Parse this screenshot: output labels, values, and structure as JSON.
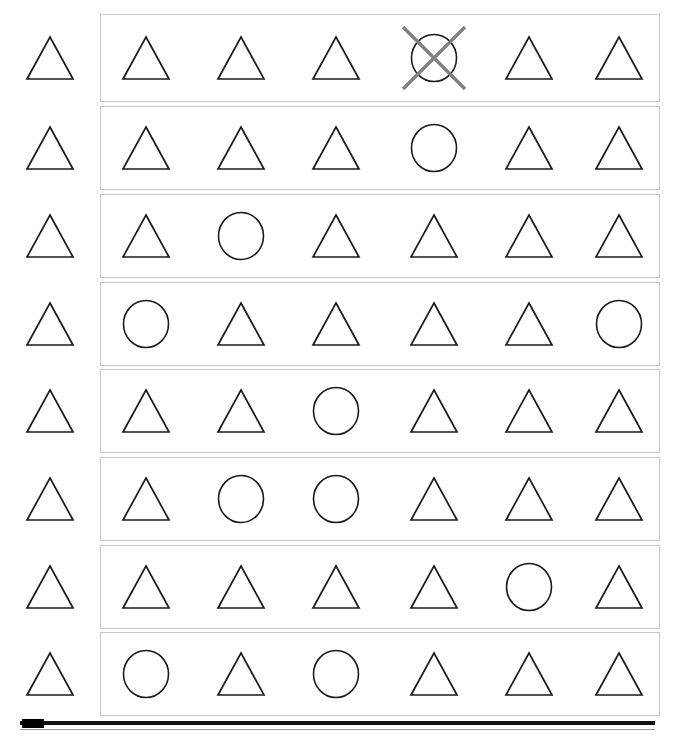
{
  "app": {
    "title": "Shape Sequence Matching Task",
    "background_color": "#ffffff"
  },
  "style": {
    "shape_stroke_color": "#1a1a1a",
    "box_border_color": "#c8c8c8",
    "cross_out_color": "#808080",
    "scrollbar_color": "#000000"
  },
  "legend": {
    "triangle_label": "triangle",
    "circle_label": "circle",
    "crossed_label": "crossed-out circle"
  },
  "grid": {
    "row_count": 8,
    "column_count": 6,
    "cue_column_label": "cue",
    "column_x": [
      45,
      140,
      235,
      333,
      428,
      518
    ],
    "rows": [
      {
        "index": 1,
        "cue": "triangle",
        "box_top": 14,
        "box_height": 88,
        "cells": [
          {
            "shape": "triangle",
            "crossed_out": false
          },
          {
            "shape": "triangle",
            "crossed_out": false
          },
          {
            "shape": "triangle",
            "crossed_out": false
          },
          {
            "shape": "circle",
            "crossed_out": true
          },
          {
            "shape": "triangle",
            "crossed_out": false
          },
          {
            "shape": "triangle",
            "crossed_out": false
          }
        ]
      },
      {
        "index": 2,
        "cue": "triangle",
        "box_top": 106,
        "box_height": 84,
        "cells": [
          {
            "shape": "triangle",
            "crossed_out": false
          },
          {
            "shape": "triangle",
            "crossed_out": false
          },
          {
            "shape": "triangle",
            "crossed_out": false
          },
          {
            "shape": "circle",
            "crossed_out": false
          },
          {
            "shape": "triangle",
            "crossed_out": false
          },
          {
            "shape": "triangle",
            "crossed_out": false
          }
        ]
      },
      {
        "index": 3,
        "cue": "triangle",
        "box_top": 194,
        "box_height": 84,
        "cells": [
          {
            "shape": "triangle",
            "crossed_out": false
          },
          {
            "shape": "circle",
            "crossed_out": false
          },
          {
            "shape": "triangle",
            "crossed_out": false
          },
          {
            "shape": "triangle",
            "crossed_out": false
          },
          {
            "shape": "triangle",
            "crossed_out": false
          },
          {
            "shape": "triangle",
            "crossed_out": false
          }
        ]
      },
      {
        "index": 4,
        "cue": "triangle",
        "box_top": 282,
        "box_height": 84,
        "cells": [
          {
            "shape": "circle",
            "crossed_out": false
          },
          {
            "shape": "triangle",
            "crossed_out": false
          },
          {
            "shape": "triangle",
            "crossed_out": false
          },
          {
            "shape": "triangle",
            "crossed_out": false
          },
          {
            "shape": "triangle",
            "crossed_out": false
          },
          {
            "shape": "circle",
            "crossed_out": false
          }
        ]
      },
      {
        "index": 5,
        "cue": "triangle",
        "box_top": 369,
        "box_height": 84,
        "cells": [
          {
            "shape": "triangle",
            "crossed_out": false
          },
          {
            "shape": "triangle",
            "crossed_out": false
          },
          {
            "shape": "circle",
            "crossed_out": false
          },
          {
            "shape": "triangle",
            "crossed_out": false
          },
          {
            "shape": "triangle",
            "crossed_out": false
          },
          {
            "shape": "triangle",
            "crossed_out": false
          }
        ]
      },
      {
        "index": 6,
        "cue": "triangle",
        "box_top": 457,
        "box_height": 84,
        "cells": [
          {
            "shape": "triangle",
            "crossed_out": false
          },
          {
            "shape": "circle",
            "crossed_out": false
          },
          {
            "shape": "circle",
            "crossed_out": false
          },
          {
            "shape": "triangle",
            "crossed_out": false
          },
          {
            "shape": "triangle",
            "crossed_out": false
          },
          {
            "shape": "triangle",
            "crossed_out": false
          }
        ]
      },
      {
        "index": 7,
        "cue": "triangle",
        "box_top": 545,
        "box_height": 84,
        "cells": [
          {
            "shape": "triangle",
            "crossed_out": false
          },
          {
            "shape": "triangle",
            "crossed_out": false
          },
          {
            "shape": "triangle",
            "crossed_out": false
          },
          {
            "shape": "triangle",
            "crossed_out": false
          },
          {
            "shape": "circle",
            "crossed_out": false
          },
          {
            "shape": "triangle",
            "crossed_out": false
          }
        ]
      },
      {
        "index": 8,
        "cue": "triangle",
        "box_top": 632,
        "box_height": 84,
        "cells": [
          {
            "shape": "circle",
            "crossed_out": false
          },
          {
            "shape": "triangle",
            "crossed_out": false
          },
          {
            "shape": "circle",
            "crossed_out": false
          },
          {
            "shape": "triangle",
            "crossed_out": false
          },
          {
            "shape": "triangle",
            "crossed_out": false
          },
          {
            "shape": "triangle",
            "crossed_out": false
          }
        ]
      }
    ]
  },
  "scrollbar": {
    "orientation": "horizontal",
    "thumb_position": "left",
    "track_left": 20,
    "track_width": 635,
    "track_top": 721
  }
}
